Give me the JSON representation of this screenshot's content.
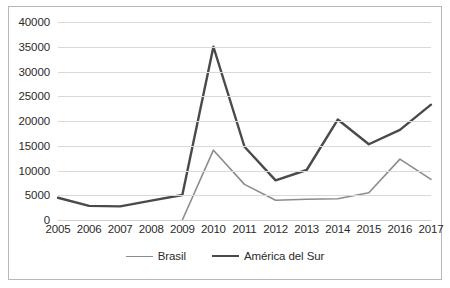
{
  "chart_data": {
    "type": "line",
    "title": "",
    "subtitle": "",
    "xlabel": "",
    "ylabel": "",
    "categories": [
      "2005",
      "2006",
      "2007",
      "2008",
      "2009",
      "2010",
      "2011",
      "2012",
      "2013",
      "2014",
      "2015",
      "2016",
      "2017"
    ],
    "ylim": [
      0,
      40000
    ],
    "ytick_values": [
      0,
      5000,
      10000,
      15000,
      20000,
      25000,
      30000,
      35000,
      40000
    ],
    "ytick_labels": [
      "0",
      "5000",
      "10000",
      "15000",
      "20000",
      "25000",
      "30000",
      "35000",
      "40000"
    ],
    "grid": true,
    "grid_axis": "y",
    "legend_position": "bottom",
    "series": [
      {
        "name": "Brasil",
        "color": "#8c8c8c",
        "line_width": 1.6,
        "values": [
          0,
          null,
          null,
          null,
          0,
          14100,
          7200,
          4000,
          4200,
          4300,
          5500,
          12300,
          8200
        ]
      },
      {
        "name": "América del Sur",
        "color": "#4a4a4a",
        "line_width": 2.4,
        "values": [
          4500,
          2850,
          2750,
          3900,
          5050,
          35000,
          14800,
          8000,
          10100,
          20300,
          15300,
          18200,
          23300
        ]
      }
    ]
  },
  "legend": {
    "entries": [
      {
        "label": "Brasil"
      },
      {
        "label": "América del Sur"
      }
    ]
  },
  "colors": {
    "frame_border": "#b8b8b8",
    "gridline": "#d9d9d9",
    "axis_text": "#2b2b2b",
    "background": "#ffffff"
  }
}
